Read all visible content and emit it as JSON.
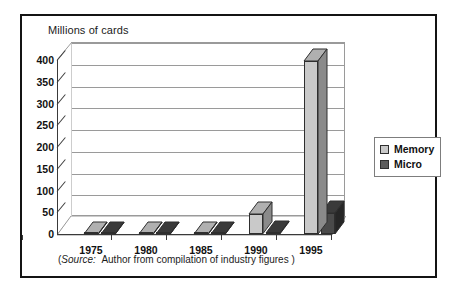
{
  "figure": {
    "title": "Millions of cards",
    "source_prefix": "(",
    "source_label": "Source:",
    "source_text": "Author from compilation of industry figures )"
  },
  "legend": {
    "items": [
      {
        "label": "Memory",
        "color": "#c9c9c9"
      },
      {
        "label": "Micro",
        "color": "#5c5c5c"
      }
    ]
  },
  "colors": {
    "memory_front": "#c9c9c9",
    "memory_side": "#8a8a8a",
    "memory_top": "#b0b0b0",
    "micro_front": "#4a4a4a",
    "micro_side": "#262626",
    "micro_top": "#3a3a3a",
    "frame": "#141414",
    "grid": "#9a9a9a",
    "axis": "#3a3a3a"
  },
  "chart_data": {
    "type": "bar",
    "title": "Millions of cards",
    "xlabel": "",
    "ylabel": "Millions of cards",
    "ylim": [
      0,
      400
    ],
    "yticks": [
      "0",
      "50",
      "100",
      "150",
      "200",
      "250",
      "300",
      "350",
      "400"
    ],
    "categories": [
      "1975",
      "1980",
      "1985",
      "1990",
      "1995"
    ],
    "grid": true,
    "legend_position": "right",
    "style": "3d-clustered-column",
    "series": [
      {
        "name": "Memory",
        "values": [
          0,
          0,
          0,
          45,
          398
        ]
      },
      {
        "name": "Micro",
        "values": [
          0,
          0,
          0,
          2,
          48
        ]
      }
    ]
  }
}
